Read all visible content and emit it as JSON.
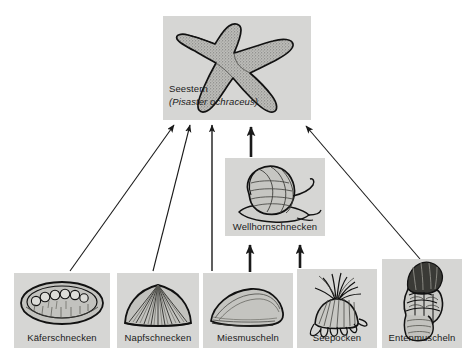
{
  "diagram": {
    "background_color": "#ffffff",
    "box_fill_color": "#d6d6d4",
    "line_color": "#1a1a1a",
    "text_color": "#1a1a1a"
  },
  "nodes": {
    "seestern": {
      "label": "Seestern",
      "scientific_name": "(Pisaster ochraceus)",
      "icon": "starfish-illustration"
    },
    "wellhornschnecken": {
      "label": "Wellhornschnecken",
      "icon": "whelk-snail-illustration"
    },
    "kaeferschnecken": {
      "label": "Käferschnecken",
      "icon": "chiton-illustration"
    },
    "napfschnecken": {
      "label": "Napfschnecken",
      "icon": "limpet-illustration"
    },
    "miesmuscheln": {
      "label": "Miesmuscheln",
      "icon": "mussel-illustration"
    },
    "seepocken": {
      "label": "Seepocken",
      "icon": "barnacle-illustration"
    },
    "entenmuscheln": {
      "label": "Entenmuscheln",
      "icon": "goose-barnacle-illustration"
    }
  },
  "edges": [
    {
      "from": "kaeferschnecken",
      "to": "seestern",
      "style": "thin-diagonal"
    },
    {
      "from": "napfschnecken",
      "to": "seestern",
      "style": "thin-diagonal"
    },
    {
      "from": "miesmuscheln",
      "to": "seestern",
      "style": "thin-vertical"
    },
    {
      "from": "wellhornschnecken",
      "to": "seestern",
      "style": "thick-vertical"
    },
    {
      "from": "entenmuscheln",
      "to": "seestern",
      "style": "thin-diagonal"
    },
    {
      "from": "miesmuscheln",
      "to": "wellhornschnecken",
      "style": "thick-vertical"
    },
    {
      "from": "seepocken",
      "to": "wellhornschnecken",
      "style": "thick-vertical"
    }
  ]
}
